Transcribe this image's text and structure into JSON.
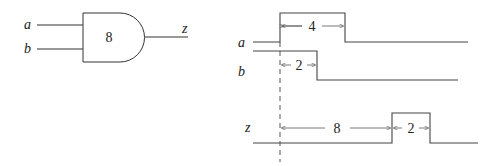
{
  "gate": {
    "type": "AND",
    "delay_label": "8",
    "inputs": [
      "a",
      "b"
    ],
    "output": "z"
  },
  "timing": {
    "signals": [
      {
        "name": "a",
        "label": "a",
        "pulse_width_label": "4"
      },
      {
        "name": "b",
        "label": "b",
        "high_duration_label": "2"
      },
      {
        "name": "z",
        "label": "z",
        "delay_label": "8",
        "pulse_width_label": "2"
      }
    ]
  }
}
